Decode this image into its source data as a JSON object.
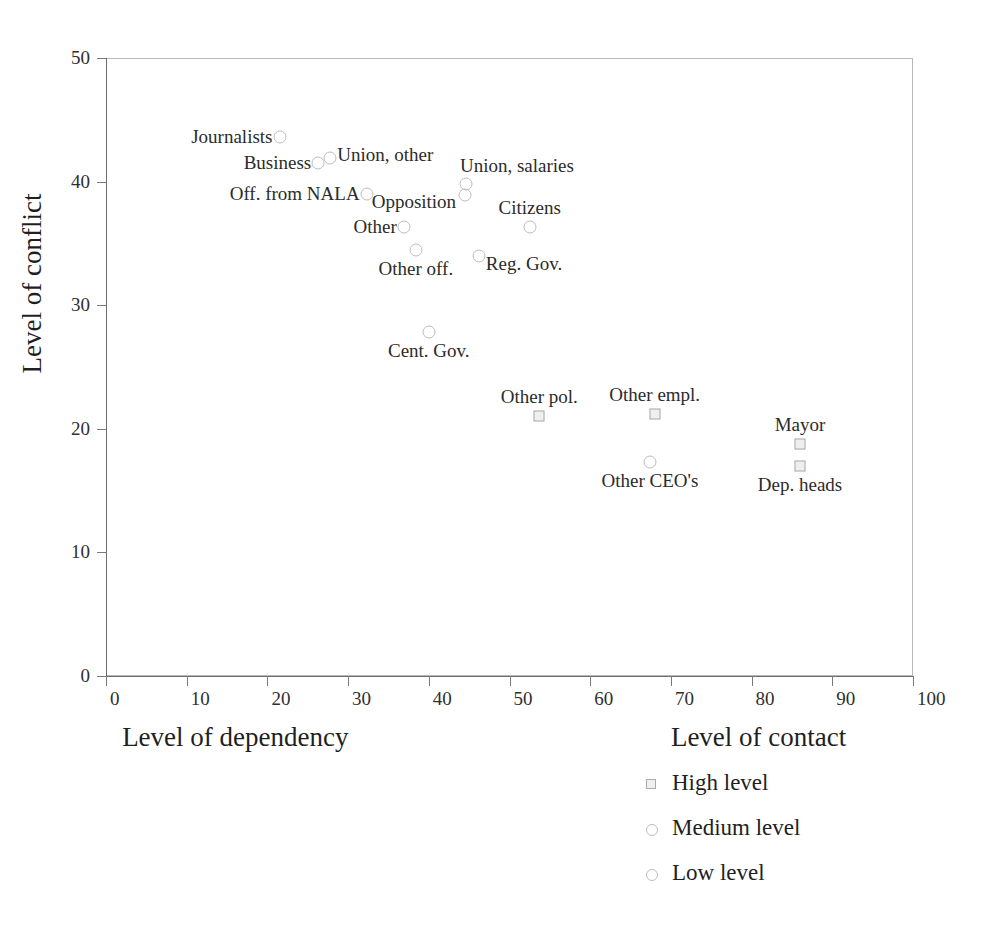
{
  "chart_data": {
    "type": "scatter",
    "title": "",
    "xlabel": "Level of dependency",
    "xlabel2": "Level of contact",
    "ylabel": "Level of conflict",
    "xlim": [
      0,
      100
    ],
    "ylim": [
      0,
      50
    ],
    "xticks": [
      0,
      10,
      20,
      30,
      40,
      50,
      60,
      70,
      80,
      90,
      100
    ],
    "yticks": [
      0,
      10,
      20,
      30,
      40,
      50
    ],
    "grid": false,
    "legend_position": "bottom-right",
    "legend": [
      {
        "label": "High level",
        "marker": "square"
      },
      {
        "label": "Medium level",
        "marker": "circle"
      },
      {
        "label": "Low level",
        "marker": "circle"
      }
    ],
    "points": [
      {
        "label": "Journalists",
        "x": 21.5,
        "y": 43.6,
        "marker": "circle",
        "label_pos": "left"
      },
      {
        "label": "Union, other",
        "x": 27.8,
        "y": 41.9,
        "marker": "circle",
        "label_pos": "right"
      },
      {
        "label": "Business",
        "x": 26.3,
        "y": 41.5,
        "marker": "circle",
        "label_pos": "left"
      },
      {
        "label": "Union, salaries",
        "x": 44.6,
        "y": 39.8,
        "marker": "circle",
        "label_pos": "above-right"
      },
      {
        "label": "Off. from NALA",
        "x": 32.3,
        "y": 39.0,
        "marker": "circle",
        "label_pos": "left"
      },
      {
        "label": "Opposition",
        "x": 44.5,
        "y": 38.9,
        "marker": "circle",
        "label_pos": "left-low"
      },
      {
        "label": "Citizens",
        "x": 52.5,
        "y": 36.3,
        "marker": "circle",
        "label_pos": "above"
      },
      {
        "label": "Other",
        "x": 36.9,
        "y": 36.3,
        "marker": "circle",
        "label_pos": "left"
      },
      {
        "label": "Other off.",
        "x": 38.4,
        "y": 34.5,
        "marker": "circle",
        "label_pos": "below"
      },
      {
        "label": "Reg. Gov.",
        "x": 46.2,
        "y": 34.0,
        "marker": "circle",
        "label_pos": "right-low"
      },
      {
        "label": "Cent. Gov.",
        "x": 40.0,
        "y": 27.8,
        "marker": "circle",
        "label_pos": "below"
      },
      {
        "label": "Other pol.",
        "x": 53.7,
        "y": 21.0,
        "marker": "square",
        "label_pos": "above"
      },
      {
        "label": "Other empl.",
        "x": 68.0,
        "y": 21.2,
        "marker": "square",
        "label_pos": "above"
      },
      {
        "label": "Mayor",
        "x": 86.0,
        "y": 18.8,
        "marker": "square",
        "label_pos": "above"
      },
      {
        "label": "Other CEO's",
        "x": 67.4,
        "y": 17.3,
        "marker": "circle",
        "label_pos": "below"
      },
      {
        "label": "Dep. heads",
        "x": 86.0,
        "y": 17.0,
        "marker": "square",
        "label_pos": "below"
      }
    ]
  }
}
